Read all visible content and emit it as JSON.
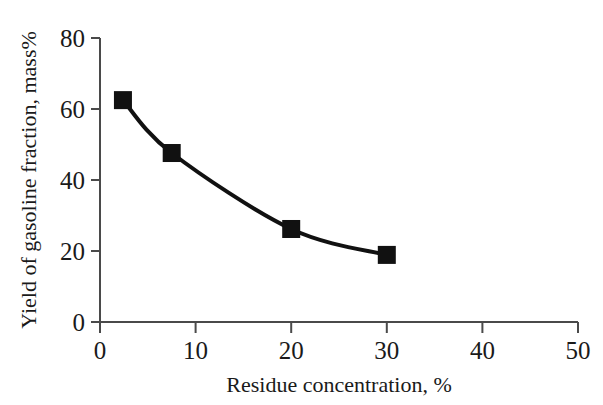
{
  "chart_data": {
    "type": "line",
    "title": "",
    "subtitle": "",
    "xlabel": "Residue concentration, %",
    "ylabel": "Yield of gasoline fraction, mass%",
    "xlim": [
      0,
      50
    ],
    "ylim": [
      0,
      80
    ],
    "xticks": [
      0,
      10,
      20,
      30,
      40,
      50
    ],
    "yticks": [
      0,
      20,
      40,
      60,
      80
    ],
    "xtick_labels": [
      "0",
      "10",
      "20",
      "30",
      "40",
      "50"
    ],
    "ytick_labels": [
      "0",
      "20",
      "40",
      "60",
      "80"
    ],
    "grid": false,
    "legend": null,
    "legend_position": "none",
    "marker": "filled-square",
    "marker_color": "#111111",
    "line_color": "#111111",
    "line_width": 4,
    "marker_size": 18,
    "axis_color": "#4a4a4a",
    "background_color": "#ffffff",
    "x": [
      2.4,
      7.5,
      20.0,
      30.0
    ],
    "values": [
      62.5,
      47.6,
      26.2,
      18.9
    ],
    "series": [
      {
        "name": "Yield of gasoline fraction",
        "points": [
          {
            "x": 2.4,
            "y": 62.5
          },
          {
            "x": 7.5,
            "y": 47.6
          },
          {
            "x": 20.0,
            "y": 26.2
          },
          {
            "x": 30.0,
            "y": 18.9
          }
        ]
      }
    ],
    "annotations": []
  }
}
